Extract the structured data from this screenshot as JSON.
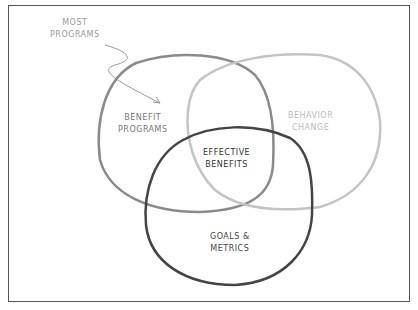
{
  "diagram": {
    "type": "venn",
    "annotation": {
      "line1": "MOST",
      "line2": "PROGRAMS"
    },
    "circles": [
      {
        "name": "benefit-programs",
        "line1": "BENEFIT",
        "line2": "PROGRAMS",
        "stroke": "#8a8a8a"
      },
      {
        "name": "behavior-change",
        "line1": "BEHAVIOR",
        "line2": "CHANGE",
        "stroke": "#c4c4c4"
      },
      {
        "name": "goals-metrics",
        "line1": "GOALS &",
        "line2": "METRICS",
        "stroke": "#444444"
      }
    ],
    "intersection": {
      "line1": "EFFECTIVE",
      "line2": "BENEFITS"
    }
  }
}
